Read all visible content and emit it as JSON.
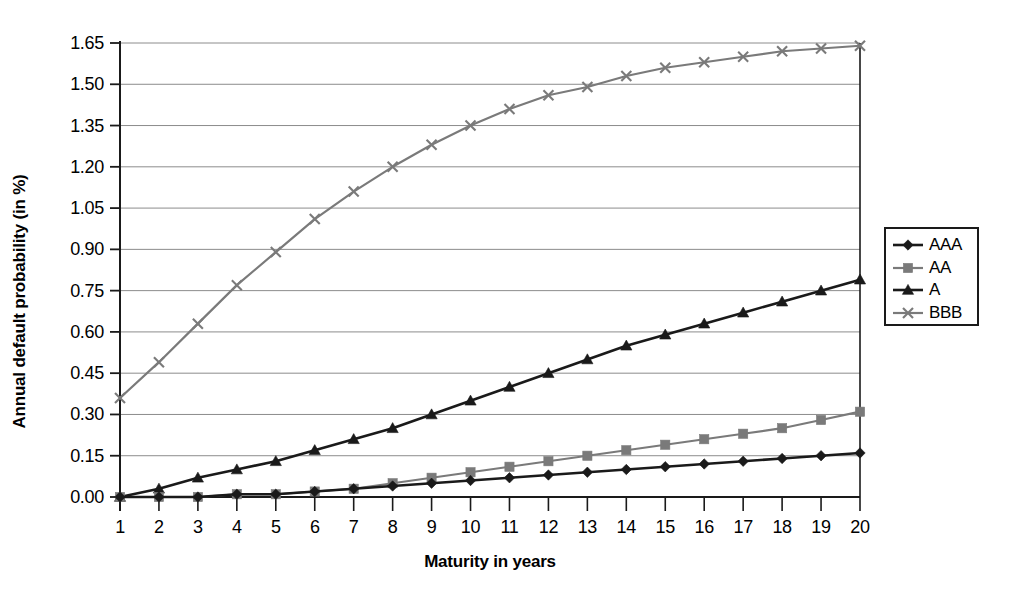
{
  "chart_data": {
    "type": "line",
    "title": "",
    "xlabel": "Maturity in years",
    "ylabel": "Annual default probability (in %)",
    "x": [
      1,
      2,
      3,
      4,
      5,
      6,
      7,
      8,
      9,
      10,
      11,
      12,
      13,
      14,
      15,
      16,
      17,
      18,
      19,
      20
    ],
    "xlim": [
      1,
      20
    ],
    "ylim": [
      0.0,
      1.65
    ],
    "yticks": [
      "0.00",
      "0.15",
      "0.30",
      "0.45",
      "0.60",
      "0.75",
      "0.90",
      "1.05",
      "1.20",
      "1.35",
      "1.50",
      "1.65"
    ],
    "xticks": [
      "1",
      "2",
      "3",
      "4",
      "5",
      "6",
      "7",
      "8",
      "9",
      "10",
      "11",
      "12",
      "13",
      "14",
      "15",
      "16",
      "17",
      "18",
      "19",
      "20"
    ],
    "grid": "horizontal",
    "legend_position": "right",
    "series": [
      {
        "name": "AAA",
        "marker": "diamond",
        "color": "#1a1a1a",
        "values": [
          0.0,
          0.0,
          0.0,
          0.01,
          0.01,
          0.02,
          0.03,
          0.04,
          0.05,
          0.06,
          0.07,
          0.08,
          0.09,
          0.1,
          0.11,
          0.12,
          0.13,
          0.14,
          0.15,
          0.16
        ]
      },
      {
        "name": "AA",
        "marker": "square",
        "color": "#7a7a7a",
        "values": [
          0.0,
          0.0,
          0.0,
          0.01,
          0.01,
          0.02,
          0.03,
          0.05,
          0.07,
          0.09,
          0.11,
          0.13,
          0.15,
          0.17,
          0.19,
          0.21,
          0.23,
          0.25,
          0.28,
          0.31
        ]
      },
      {
        "name": "A",
        "marker": "triangle",
        "color": "#1a1a1a",
        "values": [
          0.0,
          0.03,
          0.07,
          0.1,
          0.13,
          0.17,
          0.21,
          0.25,
          0.3,
          0.35,
          0.4,
          0.45,
          0.5,
          0.55,
          0.59,
          0.63,
          0.67,
          0.71,
          0.75,
          0.79
        ]
      },
      {
        "name": "BBB",
        "marker": "cross",
        "color": "#7a7a7a",
        "values": [
          0.36,
          0.49,
          0.63,
          0.77,
          0.89,
          1.01,
          1.11,
          1.2,
          1.28,
          1.35,
          1.41,
          1.46,
          1.49,
          1.53,
          1.56,
          1.58,
          1.6,
          1.62,
          1.63,
          1.64
        ]
      }
    ]
  },
  "colors": {
    "axis": "#1a1a1a",
    "grid": "#8c8c8c",
    "background": "#ffffff",
    "dark_series": "#1a1a1a",
    "gray_series": "#7a7a7a"
  }
}
